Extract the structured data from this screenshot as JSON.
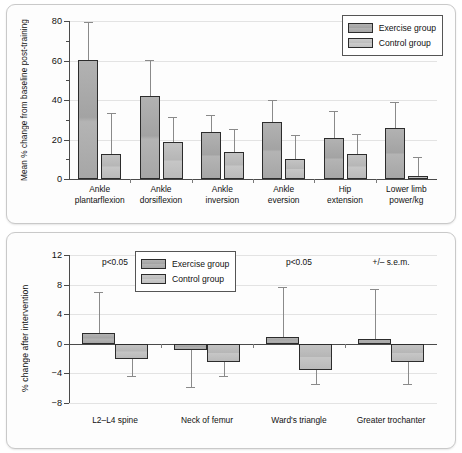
{
  "figure": {
    "legend": {
      "exercise_label": "Exercise group",
      "control_label": "Control group"
    },
    "colors": {
      "exercise": "#a8a8a8",
      "control": "#bfbfbf",
      "bar_border": "#2c2c2c",
      "error_bar": "#8a8a8a",
      "grid": "#e3e3e3",
      "axis": "#4a4a4a",
      "panel_bg": "#fdfdfd",
      "panel_border": "#c9c9c9"
    }
  },
  "chart_data": [
    {
      "id": "top",
      "type": "bar",
      "title": "",
      "xlabel": "",
      "ylabel": "Mean % change from baseline post-training",
      "ylim": [
        0,
        80
      ],
      "yticks": [
        0,
        20,
        40,
        60,
        80
      ],
      "ytick_labels": [
        "0",
        "20",
        "40",
        "60",
        "80"
      ],
      "yminor_ticks": [
        10,
        30,
        50,
        70
      ],
      "grid": true,
      "legend_position": "top-right",
      "categories": [
        "Ankle\nplantarflexion",
        "Ankle\ndorsiflexion",
        "Ankle\ninversion",
        "Ankle\neversion",
        "Hip\nextension",
        "Lower limb\npower/kg"
      ],
      "series": [
        {
          "name": "Exercise group",
          "values": [
            60.3,
            41.8,
            24.0,
            29.0,
            21.0,
            25.8
          ],
          "errors": [
            19.0,
            18.5,
            8.5,
            11.0,
            13.5,
            13.0
          ]
        },
        {
          "name": "Control group",
          "values": [
            12.8,
            18.7,
            13.5,
            10.2,
            12.9,
            1.5
          ],
          "errors": [
            20.8,
            12.5,
            12.0,
            12.0,
            10.0,
            9.8
          ]
        }
      ]
    },
    {
      "id": "bottom",
      "type": "bar",
      "title": "",
      "xlabel": "",
      "ylabel": "% change after intervention",
      "ylim": [
        -8,
        12
      ],
      "yticks": [
        -8,
        -4,
        0,
        4,
        8,
        12
      ],
      "ytick_labels": [
        "−8",
        "−4",
        "0",
        "4",
        "8",
        "12"
      ],
      "grid": true,
      "legend_position": "top-left",
      "annotations": [
        {
          "text": "p<0.05",
          "category_index": 0
        },
        {
          "text": "p<0.05",
          "category_index": 2
        },
        {
          "text": "+/– s.e.m.",
          "category_index": 3
        }
      ],
      "categories": [
        "L2–L4 spine",
        "Neck of femur",
        "Ward's triangle",
        "Greater trochanter"
      ],
      "series": [
        {
          "name": "Exercise group",
          "values": [
            1.4,
            -0.8,
            0.9,
            0.6
          ],
          "errors": [
            5.6,
            5.0,
            6.8,
            6.8
          ]
        },
        {
          "name": "Control group",
          "values": [
            -2.0,
            -2.5,
            -3.6,
            -2.5
          ],
          "errors": [
            2.4,
            1.8,
            1.8,
            2.9
          ]
        }
      ]
    }
  ]
}
